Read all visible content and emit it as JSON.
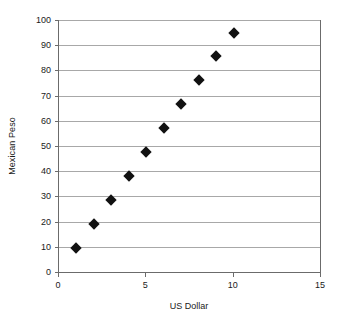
{
  "chart_data": {
    "type": "scatter",
    "title": "",
    "xlabel": "US Dollar",
    "ylabel": "Mexican Peso",
    "x": [
      1,
      2,
      3,
      4,
      5,
      6,
      7,
      8,
      9,
      10
    ],
    "values": [
      9.7,
      19,
      28.7,
      38.2,
      47.7,
      57,
      66.6,
      76,
      85.8,
      95
    ],
    "series": [
      {
        "name": "Mexican Peso",
        "marker": "diamond",
        "marker_color": "#111111",
        "points": [
          {
            "x": 1,
            "y": 9.7
          },
          {
            "x": 2,
            "y": 19
          },
          {
            "x": 3,
            "y": 28.7
          },
          {
            "x": 4,
            "y": 38.2
          },
          {
            "x": 5,
            "y": 47.7
          },
          {
            "x": 6,
            "y": 57
          },
          {
            "x": 7,
            "y": 66.6
          },
          {
            "x": 8,
            "y": 76
          },
          {
            "x": 9,
            "y": 85.8
          },
          {
            "x": 10,
            "y": 95
          }
        ]
      }
    ],
    "xlim": [
      0,
      15
    ],
    "ylim": [
      0,
      100
    ],
    "xticks": [
      0,
      5,
      10,
      15
    ],
    "yticks": [
      0,
      10,
      20,
      30,
      40,
      50,
      60,
      70,
      80,
      90,
      100
    ],
    "xtick_labels": [
      "0",
      "5",
      "10",
      "15"
    ],
    "ytick_labels": [
      "0",
      "10",
      "20",
      "30",
      "40",
      "50",
      "60",
      "70",
      "80",
      "90",
      "100"
    ],
    "grid": {
      "horizontal": true,
      "vertical": false,
      "color": "#a8a8a8"
    },
    "legend": {
      "visible": false,
      "position": "none"
    },
    "axis_color": "#6b6b6b",
    "background_color": "#ffffff"
  }
}
